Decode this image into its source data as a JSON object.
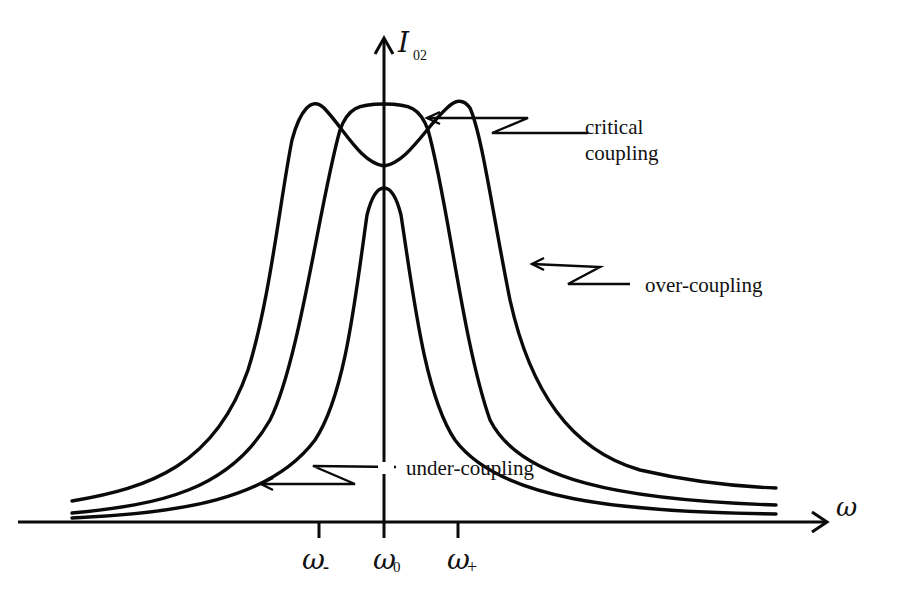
{
  "diagram": {
    "type": "resonance-curves",
    "y_axis": {
      "label": "I",
      "subscript": "02"
    },
    "x_axis": {
      "label": "ω"
    },
    "ticks": [
      {
        "id": "omega-minus",
        "symbol": "ω",
        "subscript": "-"
      },
      {
        "id": "omega-zero",
        "symbol": "ω",
        "subscript": "0"
      },
      {
        "id": "omega-plus",
        "symbol": "ω",
        "subscript": "+"
      }
    ],
    "curves": [
      {
        "id": "over-coupling",
        "label": "over-coupling",
        "shape": "double-peak"
      },
      {
        "id": "critical-coupling",
        "label_line1": "critical",
        "label_line2": "coupling",
        "shape": "flat-top"
      },
      {
        "id": "under-coupling",
        "label": "under-coupling",
        "shape": "single-peak"
      }
    ],
    "stroke_color": "#0a0a0a",
    "background": "#ffffff"
  }
}
